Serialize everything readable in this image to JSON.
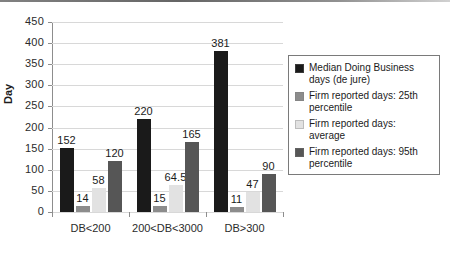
{
  "chart_data": {
    "type": "bar",
    "title": "",
    "xlabel": "",
    "ylabel": "Day",
    "ylim": [
      0,
      450
    ],
    "ytick_step": 50,
    "yticks": [
      0,
      50,
      100,
      150,
      200,
      250,
      300,
      350,
      400,
      450
    ],
    "grid": true,
    "legend_position": "right",
    "categories": [
      "DB<200",
      "200<DB<3000",
      "DB>300"
    ],
    "series": [
      {
        "name": "Median Doing Business days (de jure)",
        "color": "#1a1a1a",
        "values": [
          152,
          220,
          381
        ],
        "labels": [
          "152",
          "220",
          "381"
        ]
      },
      {
        "name": "Firm reported days: 25th percentile",
        "color": "#8c8c8c",
        "values": [
          14,
          15,
          11
        ],
        "labels": [
          "14",
          "15",
          "11"
        ]
      },
      {
        "name": "Firm reported days: average",
        "color": "#e2e2e2",
        "values": [
          58,
          64.5,
          47
        ],
        "labels": [
          "58",
          "64.5",
          "47"
        ]
      },
      {
        "name": "Firm reported days: 95th percentile",
        "color": "#565656",
        "values": [
          120,
          165,
          90
        ],
        "labels": [
          "120",
          "165",
          "90"
        ]
      }
    ]
  },
  "legend": {
    "entries": [
      {
        "label": "Median Doing Business days (de jure)",
        "color": "#1a1a1a"
      },
      {
        "label": "Firm reported days: 25th percentile",
        "color": "#8c8c8c"
      },
      {
        "label": "Firm reported days: average",
        "color": "#e2e2e2"
      },
      {
        "label": "Firm reported days: 95th percentile",
        "color": "#565656"
      }
    ]
  },
  "axes": {
    "y_title": "Day",
    "y_tick_labels": [
      "450",
      "400",
      "350",
      "300",
      "250",
      "200",
      "150",
      "100",
      "50",
      "0"
    ],
    "x_tick_labels": [
      "DB<200",
      "200<DB<3000",
      "DB>300"
    ]
  }
}
